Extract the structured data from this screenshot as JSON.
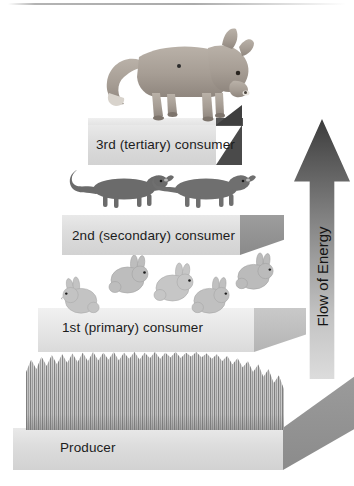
{
  "diagram": {
    "background_color": "#ffffff"
  },
  "pyramid": {
    "levels": [
      {
        "id": "tertiary",
        "label": "3rd (tertiary) consumer",
        "organism": "fox",
        "organism_count": 1,
        "order_from_top": 1,
        "block_color": "#dcdcdc",
        "side_color": "#4a4a4a"
      },
      {
        "id": "secondary",
        "label": "2nd (secondary) consumer",
        "organism": "weasel",
        "organism_count": 2,
        "order_from_top": 2,
        "block_color": "#dcdcdc",
        "side_color": "#919191"
      },
      {
        "id": "primary",
        "label": "1st (primary) consumer",
        "organism": "rabbit",
        "organism_count": 5,
        "order_from_top": 3,
        "block_color": "#e4e4e4",
        "side_color": "#bebebe"
      },
      {
        "id": "producer",
        "label": "Producer",
        "organism": "grass",
        "organism_count": 1,
        "order_from_top": 4,
        "block_color": "#e0e0e0",
        "side_color": "#919191"
      }
    ]
  },
  "energy_arrow": {
    "label": "Flow of Energy",
    "direction": "up",
    "gradient_from": "#3c3c3c",
    "gradient_to": "#dcdcdc"
  }
}
